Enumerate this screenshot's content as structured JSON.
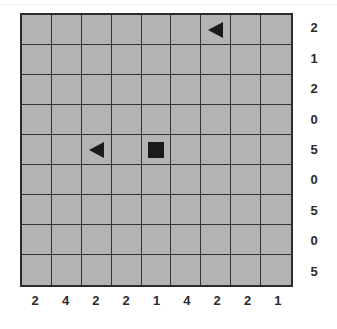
{
  "puzzle": {
    "rows": 9,
    "cols": 9,
    "row_clues": [
      "2",
      "1",
      "2",
      "0",
      "5",
      "0",
      "5",
      "0",
      "5"
    ],
    "col_clues": [
      "2",
      "4",
      "2",
      "2",
      "1",
      "4",
      "2",
      "2",
      "1"
    ],
    "pieces": [
      {
        "row": 0,
        "col": 6,
        "type": "triangle-left"
      },
      {
        "row": 4,
        "col": 2,
        "type": "triangle-left"
      },
      {
        "row": 4,
        "col": 4,
        "type": "square"
      }
    ]
  },
  "colors": {
    "cell": "#b3b3b3",
    "grid_line": "#333333",
    "piece": "#1a1a1a",
    "clue_text": "#2a2a2a"
  }
}
